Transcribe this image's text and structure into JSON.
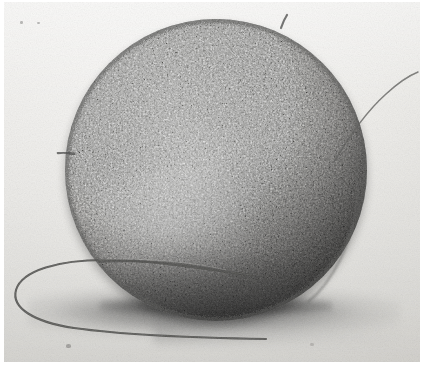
{
  "figure": {
    "kind": "scanning-electron-micrograph",
    "caption": "",
    "width_px": 424,
    "height_px": 370
  },
  "palette": {
    "background": "#eeedea",
    "background_light": "#f4f3f1",
    "background_dark": "#dedcd7",
    "cell_highlight": "#9a9a98",
    "cell_midtone": "#848482",
    "cell_shadow": "#474644",
    "filament": "#4a4a48",
    "cast_shadow": "#282828",
    "paper_white": "#ffffff"
  },
  "specimen": {
    "body_label": "cell-body",
    "center_x": 212,
    "center_y": 168,
    "radius": 151,
    "surface_texture": "granular microvilli coat",
    "bright_patch_label": "vermiform-surface-patch"
  },
  "filaments": [
    {
      "name": "flagellum-lower-left-loop",
      "description": "long filament looping out to the lower left and crossing the cell"
    },
    {
      "name": "flagellum-upper-right",
      "description": "thin filament extending off the upper right edge"
    },
    {
      "name": "flagellum-right-edge",
      "description": "filament running down the right flank of the cell"
    },
    {
      "name": "spike-top",
      "description": "short projection at the top of the cell"
    },
    {
      "name": "spike-left",
      "description": "short projection at the left edge of the cell"
    }
  ],
  "specks": [
    {
      "name": "dust-speck",
      "x": 20,
      "y": 21,
      "w": 3,
      "h": 3
    },
    {
      "name": "dust-speck",
      "x": 37,
      "y": 22,
      "w": 3,
      "h": 2
    },
    {
      "name": "dust-speck",
      "x": 66,
      "y": 344,
      "w": 5,
      "h": 4
    },
    {
      "name": "dust-speck",
      "x": 310,
      "y": 343,
      "w": 4,
      "h": 3
    },
    {
      "name": "dust-speck",
      "x": 188,
      "y": 246,
      "w": 3,
      "h": 3
    }
  ]
}
